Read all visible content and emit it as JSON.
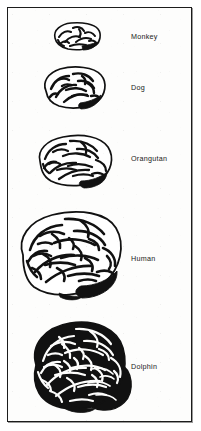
{
  "figure": {
    "border_color": "#1c1c1c",
    "background_color": "#fdfdfc",
    "ink_color": "#111111"
  },
  "specimens": [
    {
      "label": "Monkey",
      "icon": "monkey-brain-illustration",
      "relative_size": 1,
      "convolution_density": "low",
      "label_x": 131,
      "label_y": 32,
      "art_x": 51,
      "art_y": 21,
      "art_w": 46,
      "art_h": 29
    },
    {
      "label": "Dog",
      "icon": "dog-brain-illustration",
      "relative_size": 2,
      "convolution_density": "low-medium",
      "label_x": 131,
      "label_y": 83,
      "art_x": 42,
      "art_y": 66,
      "art_w": 62,
      "art_h": 42
    },
    {
      "label": "Orangutan",
      "icon": "orangutan-brain-illustration",
      "relative_size": 3,
      "convolution_density": "medium",
      "label_x": 131,
      "label_y": 154,
      "art_x": 37,
      "art_y": 134,
      "art_w": 70,
      "art_h": 48
    },
    {
      "label": "Human",
      "icon": "human-brain-illustration",
      "relative_size": 4,
      "convolution_density": "high",
      "label_x": 131,
      "label_y": 254,
      "art_x": 19,
      "art_y": 209,
      "art_w": 98,
      "art_h": 84
    },
    {
      "label": "Dolphin",
      "icon": "dolphin-brain-illustration",
      "relative_size": 5,
      "convolution_density": "very-high",
      "label_x": 131,
      "label_y": 362,
      "art_x": 26,
      "art_y": 316,
      "art_w": 100,
      "art_h": 88
    }
  ]
}
